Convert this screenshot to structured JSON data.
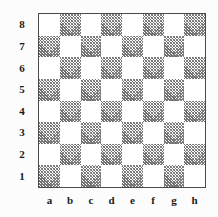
{
  "figure": {
    "kind": "chessboard-diagram",
    "background_color": "#fcfcfc",
    "border_color": "#4a4a4a",
    "light_square_color": "#ffffff",
    "dark_square_fill": "hatched-gray",
    "dark_square_color": "#7b7b7b",
    "label_color": "#1b1b1b"
  },
  "board": {
    "ranks": [
      "8",
      "7",
      "6",
      "5",
      "4",
      "3",
      "2",
      "1"
    ],
    "files": [
      "a",
      "b",
      "c",
      "d",
      "e",
      "f",
      "g",
      "h"
    ],
    "squares": [
      [
        "light",
        "dark",
        "light",
        "dark",
        "light",
        "dark",
        "light",
        "dark"
      ],
      [
        "dark",
        "light",
        "dark",
        "light",
        "dark",
        "light",
        "dark",
        "light"
      ],
      [
        "light",
        "dark",
        "light",
        "dark",
        "light",
        "dark",
        "light",
        "dark"
      ],
      [
        "dark",
        "light",
        "dark",
        "light",
        "dark",
        "light",
        "dark",
        "light"
      ],
      [
        "light",
        "dark",
        "light",
        "dark",
        "light",
        "dark",
        "light",
        "dark"
      ],
      [
        "dark",
        "light",
        "dark",
        "light",
        "dark",
        "light",
        "dark",
        "light"
      ],
      [
        "light",
        "dark",
        "light",
        "dark",
        "light",
        "dark",
        "light",
        "dark"
      ],
      [
        "dark",
        "light",
        "dark",
        "light",
        "dark",
        "light",
        "dark",
        "light"
      ]
    ],
    "pieces": []
  }
}
